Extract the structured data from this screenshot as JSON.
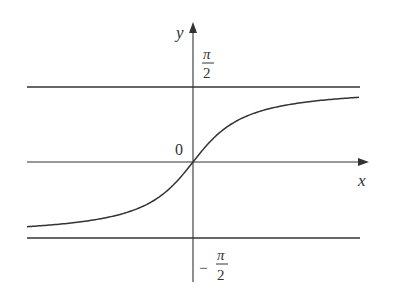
{
  "figure": {
    "function": "y = arctan(x)",
    "axis_labels": {
      "x": "x",
      "y": "y"
    },
    "origin_label": "0",
    "asymptotes": [
      {
        "position": "top",
        "label_num": "π",
        "label_den": "2",
        "sign": ""
      },
      {
        "position": "bottom",
        "label_num": "π",
        "label_den": "2",
        "sign": "−"
      }
    ],
    "colors": {
      "line": "#333333",
      "background": "#ffffff"
    }
  }
}
